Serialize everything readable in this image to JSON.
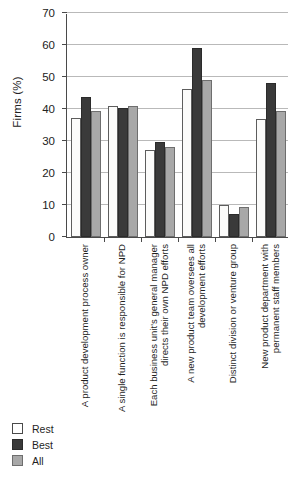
{
  "chart_data": {
    "type": "bar",
    "title": "",
    "xlabel": "",
    "ylabel": "Firms (%)",
    "ylim": [
      0,
      70
    ],
    "yticks": [
      0,
      10,
      20,
      30,
      40,
      50,
      60,
      70
    ],
    "grid": true,
    "legend_position": "bottom-left",
    "categories": [
      "A product development process owner",
      "A single function is responsible for NPD",
      "Each business unit's general manager directs their own NPD efforts",
      "A new product team oversees all development efforts",
      "Distinct division or venture group",
      "New product department with permanent staff members"
    ],
    "series": [
      {
        "name": "Rest",
        "color": "#ffffff",
        "values": [
          37.1,
          40.8,
          27.1,
          46.4,
          9.9,
          37.0
        ]
      },
      {
        "name": "Best",
        "color": "#3a3a3a",
        "values": [
          43.7,
          40.2,
          29.7,
          59.0,
          7.1,
          48.1
        ]
      },
      {
        "name": "All",
        "color": "#a8a8a8",
        "values": [
          39.3,
          40.8,
          28.1,
          49.2,
          9.3,
          39.4
        ]
      }
    ]
  },
  "legend": {
    "items": [
      {
        "label": "Rest"
      },
      {
        "label": "Best"
      },
      {
        "label": "All"
      }
    ]
  }
}
